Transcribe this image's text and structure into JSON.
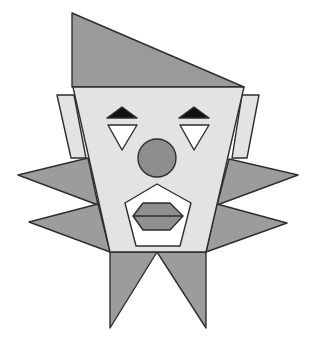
{
  "illustration": {
    "title": "Geometric clown face",
    "colors": {
      "background": "#ffffff",
      "outline": "#2e2e2e",
      "hat": "#9a9a9a",
      "face": "#e3e3e3",
      "ears": "#e3e3e3",
      "spikes": "#9c9c9c",
      "collar": "#9c9c9c",
      "eyebrow": "#111111",
      "eye": "#ffffff",
      "nose": "#8e8e8e",
      "mouth": "#ffffff",
      "lips": "#8f8f8f"
    },
    "shapes": {
      "hat": "72,13 72,87 244,87",
      "ear_left": "57,95 74,95 86,158 71,158",
      "ear_right": "242,95 259,95 247,158 232,158",
      "spike_left_upper": "88,158 18,175 98,205",
      "spike_left_lower": "98,204 29,222 110,252",
      "spike_right_upper": "229,159 298,175 217,205",
      "spike_right_lower": "217,204 287,223 206,252",
      "collar_left": "110,252 157,252 110,328",
      "collar_right": "157,252 206,252 206,328",
      "face": "73,87 244,87 206,252 110,252",
      "eyebrow_left": "107,118 122,107 137,118",
      "eyebrow_right": "179,118 194,107 209,118",
      "eye_left": "108,125 137,125 122,150",
      "eye_right": "180,125 209,125 194,150",
      "mouth": "157,184 191,203 180,246 136,246 125,203",
      "lips": "133,216 143,203 170,203 183,216 170,230 143,230"
    },
    "nose": {
      "cx": 157,
      "cy": 158,
      "r": 19
    },
    "lip_line": {
      "x1": 133,
      "y1": 216,
      "x2": 183,
      "y2": 216
    }
  }
}
